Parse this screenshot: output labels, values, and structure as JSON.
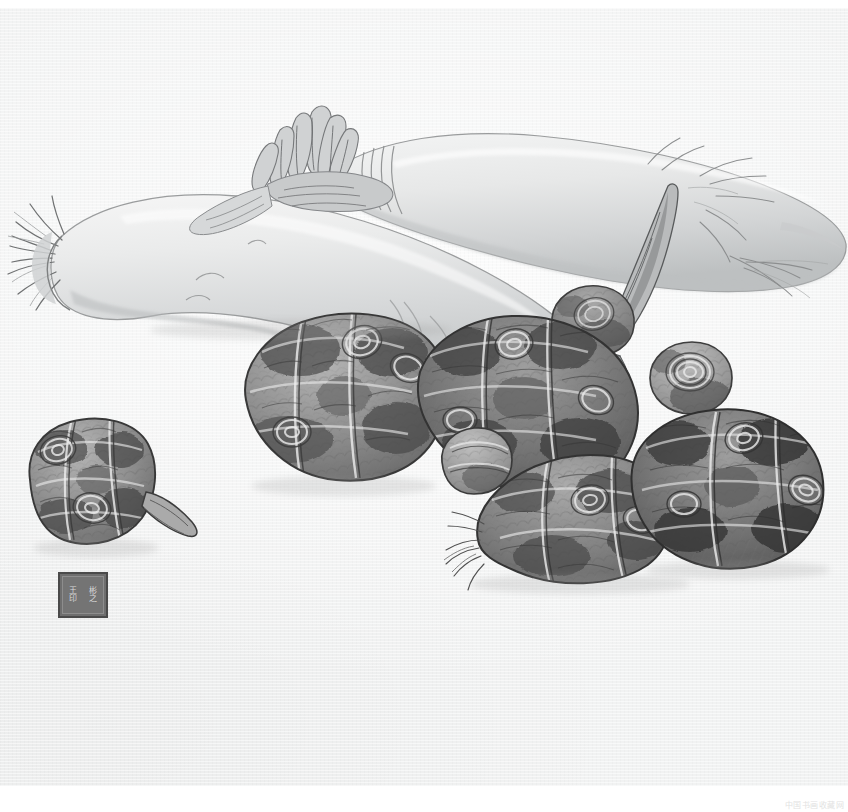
{
  "artwork": {
    "title": "Daikon Radishes and Taro Corms",
    "medium": "Chinese gongbi ink painting, monochrome on paper",
    "canvas": {
      "width": 848,
      "height": 812
    },
    "paper": {
      "left": 0,
      "top": 8,
      "width": 848,
      "height": 778,
      "color": "#f1f2f2",
      "margin_color": "#ffffff"
    },
    "palette": {
      "paper": "#f1f2f2",
      "margin": "#ffffff",
      "ink_darkest": "#3c3c3c",
      "ink_dark": "#5a5a5a",
      "ink_mid": "#8a8a8a",
      "ink_light": "#b6b6b6",
      "ink_pale": "#d6d6d6",
      "radish_body": "#e6e7e6",
      "radish_shadow": "#c9cacb",
      "taro_body": "#9a9a9a",
      "taro_dark": "#4e4e4e",
      "seal_border": "#4a4a4a",
      "seal_fill": "#6e6e6e",
      "seal_text": "#d8d8d8",
      "watermark_text": "#e2e2e2"
    },
    "subjects": [
      {
        "name": "daikon-radish-upper",
        "label": "Upper daikon radish",
        "description": "Long pale radish lying diagonally across the upper right, stem tuft at left, tapering root with fine root hairs exiting the right edge"
      },
      {
        "name": "daikon-radish-lower",
        "label": "Lower daikon radish",
        "description": "Larger pale radish across the left and center, cut stem fibers splaying at the left tip, body rendered with soft graded wash"
      },
      {
        "name": "taro-corm-left",
        "label": "Left taro corm",
        "description": "Isolated small taro at lower left with concentric ring scars and a pointed sprout stub"
      },
      {
        "name": "taro-corm-center-large",
        "label": "Central large taro corm",
        "description": "Rounded dark taro with banded scale rings, centre of the composition"
      },
      {
        "name": "taro-corm-center-right",
        "label": "Centre-right taro corm",
        "description": "Elongated taro leaning right, heavy dark ink with fibrous bands"
      },
      {
        "name": "taro-corm-small-front",
        "label": "Small front taro corm",
        "description": "Small rounded corm tucked in front of the central cluster"
      },
      {
        "name": "taro-corm-right-upper",
        "label": "Upper right taro corm",
        "description": "Small corm with a tight spiral ring scar at the upper right of the cluster"
      },
      {
        "name": "taro-corm-lower-front",
        "label": "Lower front taro corm",
        "description": "Taro with bristly root fringe at its left tip, lower centre-right"
      },
      {
        "name": "taro-corm-far-right",
        "label": "Far right taro corm",
        "description": "Darkest corm at the right edge of the cluster, deep ink shading"
      },
      {
        "name": "sprout-shoot",
        "label": "Pointed sprout shoot",
        "description": "Tall pointed shoot rising from the cluster toward the upper right"
      },
      {
        "name": "root-hairs",
        "label": "Root hairs",
        "description": "Fine whisker-like roots trailing from the radish tips"
      }
    ],
    "seal": {
      "name": "artist-seal",
      "shape": "square",
      "position": {
        "left": 58,
        "top": 572,
        "width": 50,
        "height": 46
      },
      "characters_right_column": [
        "王",
        "印"
      ],
      "characters_left_column": [
        "彬",
        "之"
      ],
      "border_color": "#4a4a4a",
      "fill_color": "#6e6e6e"
    },
    "watermark": {
      "name": "site-watermark",
      "text": "中国书画收藏网",
      "color": "#e2e2e2"
    }
  }
}
